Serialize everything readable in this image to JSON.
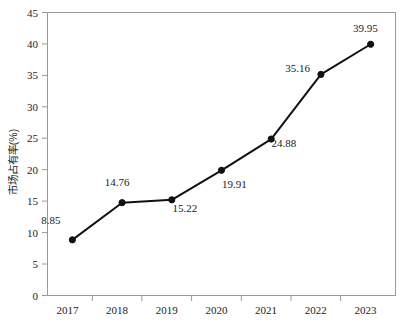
{
  "chart_data": {
    "type": "line",
    "title": "",
    "subtitle": "",
    "xlabel": "",
    "ylabel": "市场占有率(%)",
    "categories": [
      "2017",
      "2018",
      "2019",
      "2020",
      "2021",
      "2022",
      "2023"
    ],
    "values": [
      8.85,
      14.76,
      15.22,
      19.91,
      24.88,
      35.16,
      39.95
    ],
    "point_labels": [
      "8.85",
      "14.76",
      "15.22",
      "19.91",
      "24.88",
      "35.16",
      "39.95"
    ],
    "series": [
      {
        "name": "市场占有率(%)",
        "values": [
          8.85,
          14.76,
          15.22,
          19.91,
          24.88,
          35.16,
          39.95
        ]
      }
    ],
    "ylim": [
      0,
      45
    ],
    "ytick_labels": [
      "0",
      "5",
      "10",
      "15",
      "20",
      "25",
      "30",
      "35",
      "40",
      "45"
    ],
    "ytick_values": [
      0,
      5,
      10,
      15,
      20,
      25,
      30,
      35,
      40,
      45
    ],
    "xtick_labels": [
      "2017",
      "2018",
      "2019",
      "2020",
      "2021",
      "2022",
      "2023"
    ],
    "grid": false,
    "legend": false,
    "legend_position": "none",
    "marker": "circle",
    "line_color": "#111111",
    "marker_color": "#111111",
    "frame_color": "#9a9a9a",
    "background_color": "#ffffff"
  },
  "axis": {
    "y_title": "市场占有率(%)",
    "y_ticks": [
      "45",
      "40",
      "35",
      "30",
      "25",
      "20",
      "15",
      "10",
      "5",
      "0"
    ],
    "x_ticks": [
      "2017",
      "2018",
      "2019",
      "2020",
      "2021",
      "2022",
      "2023"
    ]
  },
  "labels": {
    "p0": "8.85",
    "p1": "14.76",
    "p2": "15.22",
    "p3": "19.91",
    "p4": "24.88",
    "p5": "35.16",
    "p6": "39.95"
  }
}
